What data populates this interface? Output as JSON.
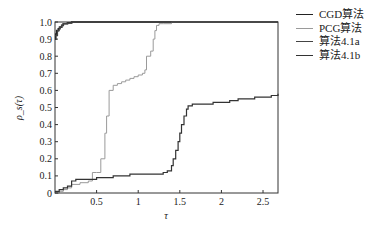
{
  "chart_data": {
    "type": "line",
    "title": "",
    "xlabel": "τ",
    "ylabel": "ρ_s(τ)",
    "xlim": [
      0,
      2.68
    ],
    "ylim": [
      0,
      1.0
    ],
    "xticks": [
      0.5,
      1,
      1.5,
      2,
      2.5
    ],
    "xtick_labels": [
      "0.5",
      "1",
      "1.5",
      "2",
      "2.5"
    ],
    "yticks": [
      0,
      0.1,
      0.2,
      0.3,
      0.4,
      0.5,
      0.6,
      0.7,
      0.8,
      0.9,
      1.0
    ],
    "ytick_labels": [
      "0",
      "0.1",
      "0.2",
      "0.3",
      "0.4",
      "0.5",
      "0.6",
      "0.7",
      "0.8",
      "0.9",
      "1.0"
    ],
    "grid": false,
    "legend_position": "right-outside-top",
    "series": [
      {
        "name": "CGD算法",
        "color": "#222222",
        "width": 1.6,
        "x": [
          0,
          0.01,
          0.02,
          0.04,
          0.06,
          0.08,
          0.1,
          0.15,
          0.2,
          0.25,
          2.68
        ],
        "y": [
          0.9,
          0.93,
          0.95,
          0.96,
          0.97,
          0.98,
          0.99,
          0.995,
          1.0,
          1.0,
          1.0
        ]
      },
      {
        "name": "PCG算法",
        "color": "#9a9a9a",
        "width": 1.0,
        "x": [
          0,
          0.05,
          0.1,
          0.15,
          0.2,
          0.3,
          0.4,
          0.45,
          0.5,
          0.55,
          0.6,
          0.62,
          0.65,
          0.7,
          0.75,
          0.8,
          0.85,
          0.9,
          0.95,
          1.0,
          1.05,
          1.08,
          1.1,
          1.15,
          1.18,
          1.2,
          1.22,
          1.25,
          1.3,
          1.4,
          1.5,
          2.68
        ],
        "y": [
          0,
          0.01,
          0.02,
          0.03,
          0.05,
          0.06,
          0.07,
          0.12,
          0.12,
          0.2,
          0.35,
          0.45,
          0.6,
          0.63,
          0.64,
          0.65,
          0.66,
          0.67,
          0.68,
          0.69,
          0.7,
          0.72,
          0.8,
          0.83,
          0.9,
          0.95,
          0.98,
          0.99,
          0.99,
          1.0,
          1.0,
          1.0
        ]
      },
      {
        "name": "算法4.1a",
        "color": "#444444",
        "width": 1.2,
        "x": [
          0,
          0.03,
          0.05,
          0.08,
          0.1,
          0.15,
          0.2,
          2.68
        ],
        "y": [
          0.92,
          0.95,
          0.97,
          0.98,
          0.99,
          0.995,
          1.0,
          1.0
        ]
      },
      {
        "name": "算法4.1b",
        "color": "#333333",
        "width": 1.2,
        "x": [
          0,
          0.05,
          0.1,
          0.15,
          0.2,
          0.25,
          0.3,
          0.4,
          0.5,
          0.6,
          0.7,
          0.8,
          0.9,
          1.0,
          1.1,
          1.2,
          1.3,
          1.35,
          1.4,
          1.42,
          1.45,
          1.48,
          1.5,
          1.52,
          1.55,
          1.58,
          1.6,
          1.65,
          1.7,
          1.8,
          1.9,
          2.0,
          2.1,
          2.2,
          2.3,
          2.4,
          2.5,
          2.6,
          2.68
        ],
        "y": [
          0.01,
          0.02,
          0.03,
          0.04,
          0.07,
          0.08,
          0.08,
          0.08,
          0.09,
          0.09,
          0.1,
          0.1,
          0.11,
          0.11,
          0.11,
          0.11,
          0.12,
          0.13,
          0.16,
          0.2,
          0.25,
          0.3,
          0.35,
          0.4,
          0.45,
          0.49,
          0.51,
          0.52,
          0.52,
          0.52,
          0.53,
          0.53,
          0.54,
          0.55,
          0.55,
          0.56,
          0.56,
          0.57,
          0.58
        ]
      }
    ]
  },
  "legend": {
    "items": [
      {
        "label": "CGD算法"
      },
      {
        "label": "PCG算法"
      },
      {
        "label": "算法4.1a"
      },
      {
        "label": "算法4.1b"
      }
    ]
  }
}
